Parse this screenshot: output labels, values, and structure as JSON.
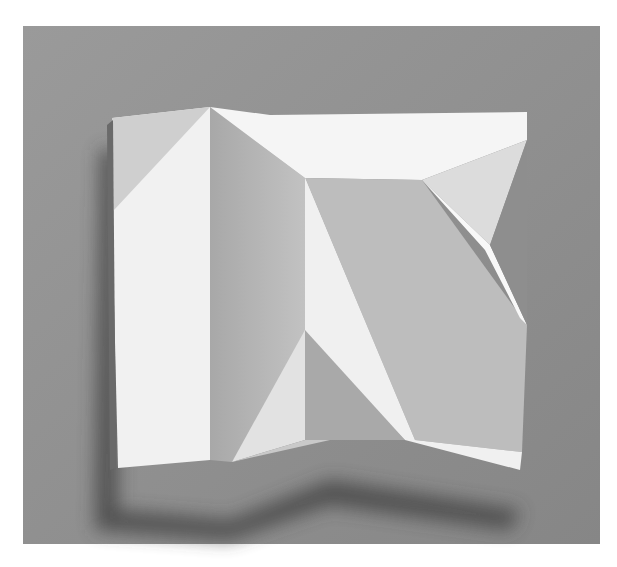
{
  "image": {
    "subject": "folded white paper relief sculpture on gray background",
    "colors": {
      "frame": "#ffffff",
      "background": "#8c8c8c",
      "background_light": "#a0a0a0",
      "paper_light": "#f4f4f4",
      "paper_mid": "#d6d6d6",
      "paper_shade": "#b4b4b4",
      "paper_dark": "#9e9e9e",
      "shadow": "#4a4a4a"
    }
  }
}
